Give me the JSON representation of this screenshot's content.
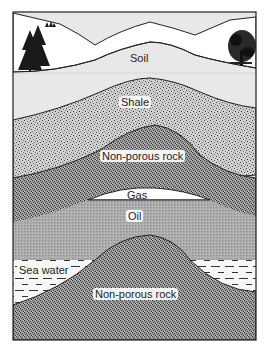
{
  "diagram": {
    "colors": {
      "frame": "#222222",
      "sky": "#ffffff",
      "soil": "#e6e6e6",
      "soil_upper": "#f0f0f0",
      "shale": "#bdbdbd",
      "nonporous_rock": "#8e8e8e",
      "gas": "#ffffff",
      "oil": "#a9a9a9",
      "sea_water": "#f6f6f6",
      "lower_rock": "#8a8a8a"
    },
    "labels": {
      "soil": "Soil",
      "shale": "Shale",
      "nonporous_rock_upper": "Non-porous rock",
      "gas": "Gas",
      "oil": "Oil",
      "sea_water": "Sea water",
      "nonporous_rock_lower": "Non-porous rock"
    },
    "layers_top_to_bottom": [
      "Soil",
      "Shale",
      "Non-porous rock",
      "Gas",
      "Oil",
      "Sea water",
      "Non-porous rock"
    ],
    "decorations": [
      "conifer trees (left)",
      "deciduous tree (right)",
      "small shrubs on hill"
    ]
  }
}
